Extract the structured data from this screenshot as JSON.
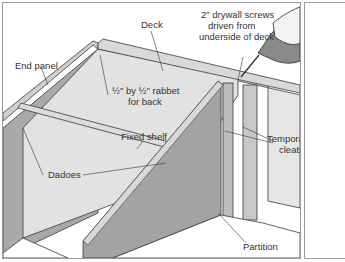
{
  "figure": {
    "labels": {
      "deck": "Deck",
      "screws_line1": "2\" drywall screws",
      "screws_line2": "driven from",
      "screws_line3": "underside of deck",
      "end_panel": "End panel",
      "rabbet_line1": "½\" by ½\" rabbet",
      "rabbet_line2": "for back",
      "fixed_shelf": "Fixed shelf",
      "temporary_line1": "Temporary",
      "temporary_line2": "cleats",
      "dadoes": "Dadoes",
      "partition": "Partition"
    },
    "colors": {
      "panel_light": "#e4e4e4",
      "panel_mid": "#bdbdbd",
      "panel_dark": "#9c9c9c",
      "edge": "#3a3a3a",
      "border": "#9a9a9a"
    }
  }
}
